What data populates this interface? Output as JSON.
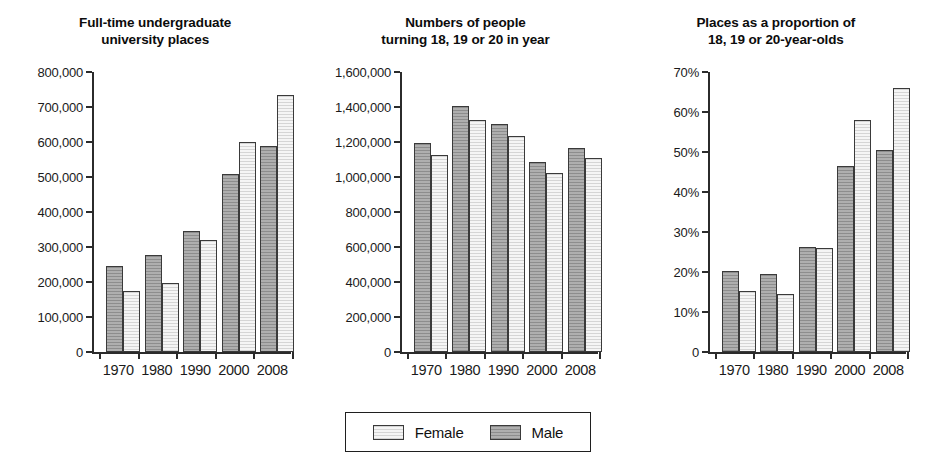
{
  "figure": {
    "background_color": "#ffffff",
    "male_color": "#9d9d9d",
    "female_color": "#e9e9e9",
    "axis_color": "#2b2b2b"
  },
  "legend": {
    "position": "bottom-center",
    "entries": [
      {
        "label": "Female",
        "swatch": "female"
      },
      {
        "label": "Male",
        "swatch": "male"
      }
    ]
  },
  "chart_data": [
    {
      "type": "bar",
      "title": "Full-time undergraduate\nuniversity places",
      "xlabel": "",
      "ylabel": "",
      "categories": [
        "1970",
        "1980",
        "1990",
        "2000",
        "2008"
      ],
      "series": [
        {
          "name": "Male",
          "values": [
            245000,
            277000,
            345000,
            508000,
            590000
          ]
        },
        {
          "name": "Female",
          "values": [
            174000,
            196000,
            320000,
            600000,
            733000
          ]
        }
      ],
      "ylim": [
        0,
        800000
      ],
      "ytick_values": [
        0,
        100000,
        200000,
        300000,
        400000,
        500000,
        600000,
        700000,
        800000
      ],
      "ytick_labels": [
        "0",
        "100,000",
        "200,000",
        "300,000",
        "400,000",
        "500,000",
        "600,000",
        "700,000",
        "800,000"
      ],
      "grid": false
    },
    {
      "type": "bar",
      "title": "Numbers of people\nturning 18, 19 or 20 in year",
      "xlabel": "",
      "ylabel": "",
      "categories": [
        "1970",
        "1980",
        "1990",
        "2000",
        "2008"
      ],
      "series": [
        {
          "name": "Male",
          "values": [
            1196000,
            1408000,
            1305000,
            1088000,
            1165000
          ]
        },
        {
          "name": "Female",
          "values": [
            1124000,
            1323000,
            1235000,
            1025000,
            1108000
          ]
        }
      ],
      "ylim": [
        0,
        1600000
      ],
      "ytick_values": [
        0,
        200000,
        400000,
        600000,
        800000,
        1000000,
        1200000,
        1400000,
        1600000
      ],
      "ytick_labels": [
        "0",
        "200,000",
        "400,000",
        "600,000",
        "800,000",
        "1,000,000",
        "1,200,000",
        "1,400,000",
        "1,600,000"
      ],
      "grid": false
    },
    {
      "type": "bar",
      "title": "Places as a proportion of\n18, 19 or 20-year-olds",
      "xlabel": "",
      "ylabel": "",
      "categories": [
        "1970",
        "1980",
        "1990",
        "2000",
        "2008"
      ],
      "series": [
        {
          "name": "Male",
          "values": [
            20.2,
            19.6,
            26.2,
            46.6,
            50.4
          ]
        },
        {
          "name": "Female",
          "values": [
            15.2,
            14.6,
            26.0,
            58.0,
            66.0
          ]
        }
      ],
      "ylim": [
        0,
        70
      ],
      "ytick_values": [
        0,
        10,
        20,
        30,
        40,
        50,
        60,
        70
      ],
      "ytick_labels": [
        "0",
        "10%",
        "20%",
        "30%",
        "40%",
        "50%",
        "60%",
        "70%"
      ],
      "grid": false
    }
  ]
}
